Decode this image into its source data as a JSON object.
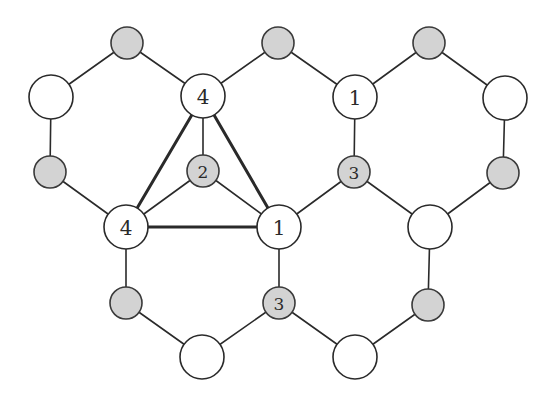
{
  "diagram": {
    "title": "",
    "colors": {
      "line": "#2a2a2a",
      "white_node_fill": "#ffffff",
      "gray_node_fill": "#d3d3d3"
    },
    "nodes": [
      {
        "id": "g1",
        "x": 127,
        "y": 43,
        "r": 16,
        "type": "gray",
        "label": ""
      },
      {
        "id": "g2",
        "x": 278,
        "y": 43,
        "r": 16,
        "type": "gray",
        "label": ""
      },
      {
        "id": "g3",
        "x": 429,
        "y": 43,
        "r": 16,
        "type": "gray",
        "label": ""
      },
      {
        "id": "w1",
        "x": 51,
        "y": 97,
        "r": 22,
        "type": "white",
        "label": ""
      },
      {
        "id": "w2",
        "x": 203,
        "y": 96,
        "r": 22,
        "type": "white",
        "label": "4"
      },
      {
        "id": "w3",
        "x": 355,
        "y": 97,
        "r": 22,
        "type": "white",
        "label": "1"
      },
      {
        "id": "w4",
        "x": 505,
        "y": 98,
        "r": 22,
        "type": "white",
        "label": ""
      },
      {
        "id": "g4",
        "x": 50,
        "y": 172,
        "r": 16,
        "type": "gray",
        "label": ""
      },
      {
        "id": "g5",
        "x": 203,
        "y": 171,
        "r": 16,
        "type": "gray",
        "label": "2"
      },
      {
        "id": "g6",
        "x": 354,
        "y": 172,
        "r": 16,
        "type": "gray",
        "label": "3"
      },
      {
        "id": "g7",
        "x": 503,
        "y": 173,
        "r": 16,
        "type": "gray",
        "label": ""
      },
      {
        "id": "w5",
        "x": 126,
        "y": 227,
        "r": 22,
        "type": "white",
        "label": "4"
      },
      {
        "id": "w6",
        "x": 279,
        "y": 227,
        "r": 22,
        "type": "white",
        "label": "1"
      },
      {
        "id": "w7",
        "x": 430,
        "y": 227,
        "r": 22,
        "type": "white",
        "label": ""
      },
      {
        "id": "g8",
        "x": 126,
        "y": 303,
        "r": 16,
        "type": "gray",
        "label": ""
      },
      {
        "id": "g9",
        "x": 279,
        "y": 303,
        "r": 16,
        "type": "gray",
        "label": "3"
      },
      {
        "id": "g10",
        "x": 428,
        "y": 305,
        "r": 16,
        "type": "gray",
        "label": ""
      },
      {
        "id": "w8",
        "x": 202,
        "y": 357,
        "r": 22,
        "type": "white",
        "label": ""
      },
      {
        "id": "w9",
        "x": 355,
        "y": 357,
        "r": 22,
        "type": "white",
        "label": ""
      }
    ],
    "edges": [
      {
        "from": "w1",
        "to": "g1",
        "bold": false
      },
      {
        "from": "g1",
        "to": "w2",
        "bold": false
      },
      {
        "from": "w2",
        "to": "g2",
        "bold": false
      },
      {
        "from": "g2",
        "to": "w3",
        "bold": false
      },
      {
        "from": "w3",
        "to": "g3",
        "bold": false
      },
      {
        "from": "g3",
        "to": "w4",
        "bold": false
      },
      {
        "from": "w1",
        "to": "g4",
        "bold": false
      },
      {
        "from": "w2",
        "to": "g5",
        "bold": false
      },
      {
        "from": "w3",
        "to": "g6",
        "bold": false
      },
      {
        "from": "w4",
        "to": "g7",
        "bold": false
      },
      {
        "from": "g4",
        "to": "w5",
        "bold": false
      },
      {
        "from": "g5",
        "to": "w5",
        "bold": false
      },
      {
        "from": "g5",
        "to": "w6",
        "bold": false
      },
      {
        "from": "g6",
        "to": "w6",
        "bold": false
      },
      {
        "from": "g6",
        "to": "w7",
        "bold": false
      },
      {
        "from": "g7",
        "to": "w7",
        "bold": false
      },
      {
        "from": "w5",
        "to": "g8",
        "bold": false
      },
      {
        "from": "w6",
        "to": "g9",
        "bold": false
      },
      {
        "from": "w7",
        "to": "g10",
        "bold": false
      },
      {
        "from": "g8",
        "to": "w8",
        "bold": false
      },
      {
        "from": "w8",
        "to": "g9",
        "bold": false
      },
      {
        "from": "g9",
        "to": "w9",
        "bold": false
      },
      {
        "from": "w9",
        "to": "g10",
        "bold": false
      },
      {
        "from": "w2",
        "to": "w5",
        "bold": true
      },
      {
        "from": "w2",
        "to": "w6",
        "bold": true
      },
      {
        "from": "w5",
        "to": "w6",
        "bold": true
      }
    ]
  }
}
